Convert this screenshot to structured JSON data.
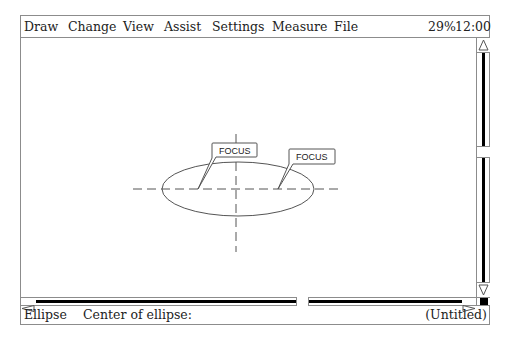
{
  "menubar": {
    "items": [
      {
        "label": "Draw",
        "x": 3
      },
      {
        "label": "Change",
        "x": 47
      },
      {
        "label": "View",
        "x": 102
      },
      {
        "label": "Assist",
        "x": 143
      },
      {
        "label": "Settings",
        "x": 191
      },
      {
        "label": "Measure",
        "x": 251
      },
      {
        "label": "File",
        "x": 313
      }
    ],
    "zoom_level": "29%",
    "clock": "12:00"
  },
  "canvas": {
    "ellipse": {
      "cx": 217,
      "cy": 151,
      "rx": 76,
      "ry": 27
    },
    "callouts": [
      {
        "label": "FOCUS",
        "point": [
          177,
          151
        ]
      },
      {
        "label": "FOCUS",
        "point": [
          257,
          151
        ]
      }
    ]
  },
  "scrollbars": {
    "vertical": {
      "up_icon": "triangle-up",
      "down_icon": "triangle-down"
    },
    "horizontal": {
      "left_icon": "triangle-left",
      "right_icon": "triangle-right"
    }
  },
  "statusbar": {
    "tool": "Ellipse",
    "prompt": "Center of ellipse:",
    "document_name": "(Untitled)"
  },
  "colors": {
    "border": "#8c8c8c",
    "stroke": "#555555",
    "text": "#222222",
    "track": "#000000"
  }
}
